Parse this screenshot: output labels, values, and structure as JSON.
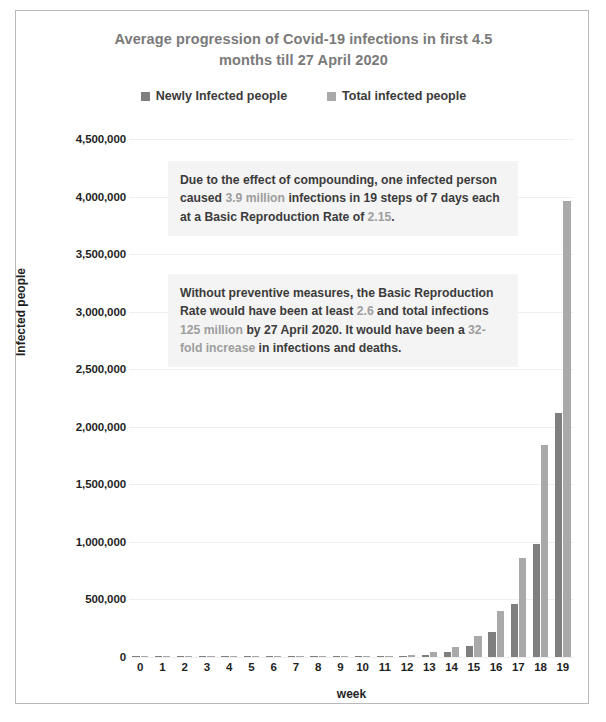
{
  "chart": {
    "title": "Average progression of Covid-19 infections in first 4.5 months till 27 April 2020",
    "title_line_1": "Average progression of Covid-19 infections in first 4.5",
    "title_line_2": "months till 27 April 2020",
    "xlabel": "week",
    "ylabel": "Infected people"
  },
  "legend": {
    "items": [
      {
        "label": "Newly Infected people",
        "color": "#7f7f7f"
      },
      {
        "label": "Total infected people",
        "color": "#a9a9a9"
      }
    ]
  },
  "annotations": [
    {
      "id": "annotation-1",
      "segments": [
        {
          "text": "Due to the effect of compounding, one infected person caused ",
          "highlight": false
        },
        {
          "text": "3.9 million",
          "highlight": true
        },
        {
          "text": " infections in 19 steps of 7 days each at a Basic Reproduction Rate of ",
          "highlight": false
        },
        {
          "text": "2.15",
          "highlight": true
        },
        {
          "text": ".",
          "highlight": false
        }
      ]
    },
    {
      "id": "annotation-2",
      "segments": [
        {
          "text": "Without preventive measures, the Basic Reproduction Rate would have been at least ",
          "highlight": false
        },
        {
          "text": "2.6",
          "highlight": true
        },
        {
          "text": " and total infections ",
          "highlight": false
        },
        {
          "text": "125 million",
          "highlight": true
        },
        {
          "text": " by 27 April 2020. It would have been a ",
          "highlight": false
        },
        {
          "text": "32-fold increase",
          "highlight": true
        },
        {
          "text": " in infections and deaths.",
          "highlight": false
        }
      ]
    }
  ],
  "chart_data": {
    "type": "bar",
    "title": "Average progression of Covid-19 infections in first 4.5 months till 27 April 2020",
    "xlabel": "week",
    "ylabel": "Infected people",
    "grid": true,
    "legend_position": "top",
    "categories": [
      "0",
      "1",
      "2",
      "3",
      "4",
      "5",
      "6",
      "7",
      "8",
      "9",
      "10",
      "11",
      "12",
      "13",
      "14",
      "15",
      "16",
      "17",
      "18",
      "19"
    ],
    "ylim": [
      0,
      4500000
    ],
    "ytick_values": [
      0,
      500000,
      1000000,
      1500000,
      2000000,
      2500000,
      3000000,
      3500000,
      4000000,
      4500000
    ],
    "ytick_labels": [
      "0",
      "500,000",
      "1,000,000",
      "1,500,000",
      "2,000,000",
      "2,500,000",
      "3,000,000",
      "3,500,000",
      "4,000,000",
      "4,500,000"
    ],
    "series": [
      {
        "name": "Newly Infected people",
        "color": "#7f7f7f",
        "values": [
          1,
          2,
          5,
          10,
          22,
          47,
          101,
          217,
          467,
          1004,
          2159,
          4641,
          9979,
          21455,
          46128,
          99175,
          213227,
          458438,
          985641,
          2119128
        ]
      },
      {
        "name": "Total infected people",
        "color": "#a9a9a9",
        "values": [
          1,
          3,
          8,
          18,
          40,
          87,
          188,
          405,
          872,
          1876,
          4035,
          8676,
          18655,
          40110,
          86238,
          185413,
          398640,
          857078,
          1842719,
          3961847
        ]
      }
    ]
  }
}
